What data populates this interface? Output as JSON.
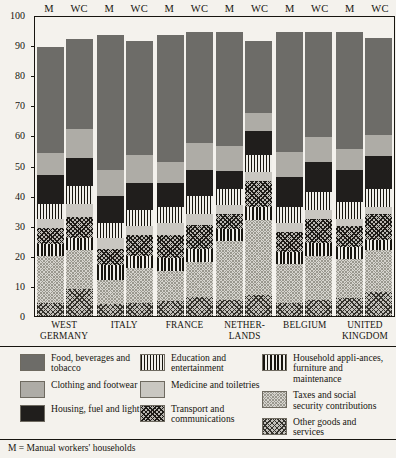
{
  "axis": {
    "ticks": [
      0,
      10,
      20,
      30,
      40,
      50,
      60,
      70,
      80,
      90,
      100
    ],
    "max": 100,
    "min": 0
  },
  "column_headers": [
    "M",
    "WC"
  ],
  "countries": [
    "WEST GERMANY",
    "ITALY",
    "FRANCE",
    "NETHER-LANDS",
    "BELGIUM",
    "UNITED KINGDOM"
  ],
  "footnote": "M = Manual workers' households",
  "legend": {
    "columns": [
      [
        {
          "key": "food",
          "label": "Food, beverages and tobacco",
          "fill": "f-food",
          "color": "#6d6c68"
        },
        {
          "key": "clothing",
          "label": "Clothing and footwear",
          "fill": "f-clothing",
          "color": "#aeaca6"
        },
        {
          "key": "housing",
          "label": "Housing, fuel and light",
          "fill": "f-housing",
          "color": "#201e1c"
        }
      ],
      [
        {
          "key": "education",
          "label": "Education and entertainment",
          "fill": "f-education",
          "color": "#17150f"
        },
        {
          "key": "medicine",
          "label": "Medicine and toiletries",
          "fill": "f-medicine",
          "color": "#c9c7c1"
        },
        {
          "key": "transport",
          "label": "Transport and communications",
          "fill": "f-transport",
          "color": "#1d1b17"
        }
      ],
      [
        {
          "key": "appliances",
          "label": "Household appli-ances, furniture and maintenance",
          "fill": "f-appliances",
          "color": "#17150f"
        },
        {
          "key": "taxes",
          "label": "Taxes and social security contributions",
          "fill": "f-taxes",
          "color": "#d6d4ce"
        },
        {
          "key": "other",
          "label": "Other goods and services",
          "fill": "f-other",
          "color": "#c2c0ba"
        }
      ]
    ]
  },
  "chart_data": {
    "type": "bar",
    "subtype": "stacked-100-percent",
    "title": "",
    "xlabel": "",
    "ylabel": "",
    "ylim": [
      0,
      100
    ],
    "grid": false,
    "legend_position": "bottom",
    "categories": [
      "WEST GERMANY",
      "ITALY",
      "FRANCE",
      "NETHERLANDS",
      "BELGIUM",
      "UNITED KINGDOM"
    ],
    "group_labels": [
      "M",
      "WC"
    ],
    "stack_order_bottom_to_top": [
      "other",
      "taxes",
      "appliances",
      "transport",
      "medicine",
      "education",
      "housing",
      "clothing",
      "food"
    ],
    "series": [
      {
        "name": "other",
        "label": "Other goods and services",
        "values": {
          "WEST GERMANY": {
            "M": 4.5,
            "WC": 9.0
          },
          "ITALY": {
            "M": 4.0,
            "WC": 4.5
          },
          "FRANCE": {
            "M": 5.0,
            "WC": 6.5
          },
          "NETHERLANDS": {
            "M": 5.5,
            "WC": 7.0
          },
          "BELGIUM": {
            "M": 4.5,
            "WC": 5.5
          },
          "UNITED KINGDOM": {
            "M": 6.0,
            "WC": 8.0
          }
        }
      },
      {
        "name": "taxes",
        "label": "Taxes and social security contributions",
        "values": {
          "WEST GERMANY": {
            "M": 15.5,
            "WC": 13.0
          },
          "ITALY": {
            "M": 8.0,
            "WC": 11.5
          },
          "FRANCE": {
            "M": 10.0,
            "WC": 11.5
          },
          "NETHERLANDS": {
            "M": 19.5,
            "WC": 25.0
          },
          "BELGIUM": {
            "M": 13.0,
            "WC": 14.5
          },
          "UNITED KINGDOM": {
            "M": 13.0,
            "WC": 14.0
          }
        }
      },
      {
        "name": "appliances",
        "label": "Household appliances, furniture and maintenance",
        "values": {
          "WEST GERMANY": {
            "M": 4.0,
            "WC": 4.0
          },
          "ITALY": {
            "M": 5.0,
            "WC": 4.0
          },
          "FRANCE": {
            "M": 4.5,
            "WC": 4.5
          },
          "NETHERLANDS": {
            "M": 4.0,
            "WC": 4.5
          },
          "BELGIUM": {
            "M": 4.0,
            "WC": 4.5
          },
          "UNITED KINGDOM": {
            "M": 4.0,
            "WC": 3.5
          }
        }
      },
      {
        "name": "transport",
        "label": "Transport and communications",
        "values": {
          "WEST GERMANY": {
            "M": 5.5,
            "WC": 7.0
          },
          "ITALY": {
            "M": 5.5,
            "WC": 7.0
          },
          "FRANCE": {
            "M": 7.5,
            "WC": 8.0
          },
          "NETHERLANDS": {
            "M": 5.0,
            "WC": 8.5
          },
          "BELGIUM": {
            "M": 6.5,
            "WC": 8.0
          },
          "UNITED KINGDOM": {
            "M": 7.0,
            "WC": 8.5
          }
        }
      },
      {
        "name": "medicine",
        "label": "Medicine and toiletries",
        "values": {
          "WEST GERMANY": {
            "M": 3.0,
            "WC": 4.5
          },
          "ITALY": {
            "M": 3.5,
            "WC": 3.0
          },
          "FRANCE": {
            "M": 4.0,
            "WC": 3.5
          },
          "NETHERLANDS": {
            "M": 3.0,
            "WC": 3.0
          },
          "BELGIUM": {
            "M": 3.0,
            "WC": 3.0
          },
          "UNITED KINGDOM": {
            "M": 2.5,
            "WC": 2.5
          }
        }
      },
      {
        "name": "education",
        "label": "Education and entertainment",
        "values": {
          "WEST GERMANY": {
            "M": 5.0,
            "WC": 6.0
          },
          "ITALY": {
            "M": 5.0,
            "WC": 5.5
          },
          "FRANCE": {
            "M": 5.5,
            "WC": 6.0
          },
          "NETHERLANDS": {
            "M": 5.5,
            "WC": 6.0
          },
          "BELGIUM": {
            "M": 5.5,
            "WC": 6.0
          },
          "UNITED KINGDOM": {
            "M": 5.5,
            "WC": 6.0
          }
        }
      },
      {
        "name": "housing",
        "label": "Housing, fuel and light",
        "values": {
          "WEST GERMANY": {
            "M": 9.5,
            "WC": 9.5
          },
          "ITALY": {
            "M": 9.0,
            "WC": 9.0
          },
          "FRANCE": {
            "M": 8.0,
            "WC": 9.0
          },
          "NETHERLANDS": {
            "M": 6.0,
            "WC": 8.0
          },
          "BELGIUM": {
            "M": 10.0,
            "WC": 10.0
          },
          "UNITED KINGDOM": {
            "M": 11.0,
            "WC": 11.0
          }
        }
      },
      {
        "name": "clothing",
        "label": "Clothing and footwear",
        "values": {
          "WEST GERMANY": {
            "M": 7.5,
            "WC": 9.5
          },
          "ITALY": {
            "M": 9.0,
            "WC": 9.5
          },
          "FRANCE": {
            "M": 7.0,
            "WC": 9.0
          },
          "NETHERLANDS": {
            "M": 8.5,
            "WC": 6.0
          },
          "BELGIUM": {
            "M": 8.5,
            "WC": 8.5
          },
          "UNITED KINGDOM": {
            "M": 7.0,
            "WC": 7.0
          }
        }
      },
      {
        "name": "food",
        "label": "Food, beverages and tobacco",
        "values": {
          "WEST GERMANY": {
            "M": 35.5,
            "WC": 30.0
          },
          "ITALY": {
            "M": 45.0,
            "WC": 38.0
          },
          "FRANCE": {
            "M": 42.5,
            "WC": 37.0
          },
          "NETHERLANDS": {
            "M": 38.0,
            "WC": 24.0
          },
          "BELGIUM": {
            "M": 40.0,
            "WC": 35.0
          },
          "UNITED KINGDOM": {
            "M": 39.0,
            "WC": 32.5
          }
        }
      }
    ]
  }
}
